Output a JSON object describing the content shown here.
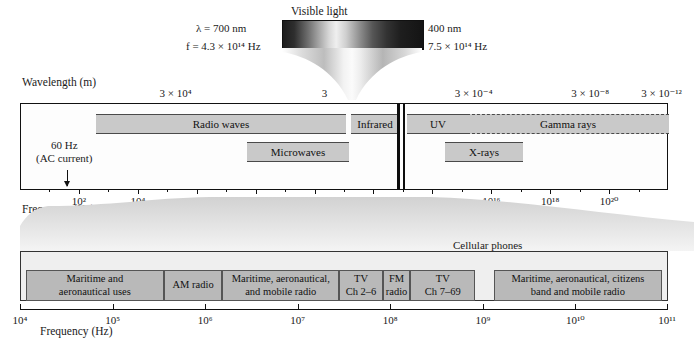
{
  "figure": {
    "visible_light": {
      "label": "Visible light",
      "left_wavelength": "λ = 700 nm",
      "left_frequency": "f = 4.3 × 10¹⁴ Hz",
      "right_wavelength": "400 nm",
      "right_frequency": "7.5 × 10¹⁴ Hz"
    }
  },
  "top_panel": {
    "wavelength_axis": {
      "title": "Wavelength (m)",
      "ticks": [
        {
          "label": "3 × 10⁴",
          "pct": 24.0
        },
        {
          "label": "3",
          "pct": 47.0
        },
        {
          "label": "3 × 10⁻⁴",
          "pct": 70.0
        },
        {
          "label": "3 × 10⁻⁸",
          "pct": 88.0
        },
        {
          "label": "3 × 10⁻¹²",
          "pct": 99.0
        }
      ]
    },
    "frequency_axis": {
      "title": "Frequency (Hz)",
      "ticks": [
        "10²",
        "10⁴",
        "10⁶",
        "10⁸",
        "10¹⁰",
        "10¹²",
        "10¹⁴",
        "10¹⁶",
        "10¹⁸",
        "10²⁰"
      ]
    },
    "annotation": {
      "line1": "60 Hz",
      "line2": "(AC current)"
    },
    "bands": [
      {
        "label": "Radio waves",
        "row": 1
      },
      {
        "label": "Infrared",
        "row": 1
      },
      {
        "label": "UV",
        "row": 1
      },
      {
        "label": "Gamma rays",
        "row": 1
      },
      {
        "label": "Microwaves",
        "row": 2
      },
      {
        "label": "X-rays",
        "row": 2
      }
    ]
  },
  "bottom_panel": {
    "callout": "Cellular phones",
    "frequency_axis": {
      "title": "Frequency (Hz)",
      "ticks": [
        "10⁴",
        "10⁵",
        "10⁶",
        "10⁷",
        "10⁸",
        "10⁹",
        "10¹⁰",
        "10¹¹"
      ]
    },
    "bands": [
      {
        "line1": "Maritime and",
        "line2": "aeronautical uses"
      },
      {
        "line1": "AM radio",
        "line2": ""
      },
      {
        "line1": "Maritime, aeronautical,",
        "line2": "and mobile radio"
      },
      {
        "line1": "TV",
        "line2": "Ch 2–6"
      },
      {
        "line1": "FM",
        "line2": "radio"
      },
      {
        "line1": "TV",
        "line2": "Ch 7–69"
      },
      {
        "line1": "Maritime, aeronautical, citizens",
        "line2": "band and mobile radio"
      }
    ]
  },
  "chart_data": {
    "type": "bar",
    "xlabel": "Frequency (Hz)",
    "ylabel": "",
    "grid": false,
    "legend": "none",
    "panels": [
      {
        "name": "full-spectrum",
        "x_axis": {
          "label": "Frequency (Hz)",
          "scale": "log10",
          "ticks": [
            2,
            4,
            6,
            8,
            10,
            12,
            14,
            16,
            18,
            20
          ],
          "tick_labels": [
            "10²",
            "10⁴",
            "10⁶",
            "10⁸",
            "10¹⁰",
            "10¹²",
            "10¹⁴",
            "10¹⁶",
            "10¹⁸",
            "10²⁰"
          ],
          "range": [
            0,
            22
          ]
        },
        "secondary_axis": {
          "label": "Wavelength (m)",
          "scale": "log10",
          "tick_labels": [
            "3 × 10⁴",
            "3",
            "3 × 10⁻⁴",
            "3 × 10⁻⁸",
            "3 × 10⁻¹²"
          ]
        },
        "bands": [
          {
            "name": "Radio waves",
            "f_min_log10": 3.0,
            "f_max_log10": 11.5,
            "row": 1
          },
          {
            "name": "Microwaves",
            "f_min_log10": 9.0,
            "f_max_log10": 12.0,
            "row": 2
          },
          {
            "name": "Infrared",
            "f_min_log10": 11.7,
            "f_max_log10": 14.4,
            "row": 1
          },
          {
            "name": "Visible light",
            "f_min_log10": 14.63,
            "f_max_log10": 14.88,
            "row": 0
          },
          {
            "name": "UV",
            "f_min_log10": 14.9,
            "f_max_log10": 16.3,
            "row": 1
          },
          {
            "name": "X-rays",
            "f_min_log10": 16.0,
            "f_max_log10": 19.2,
            "row": 2
          },
          {
            "name": "Gamma rays",
            "f_min_log10": 18.0,
            "f_max_log10": 22.0,
            "row": 1
          }
        ],
        "annotations": [
          {
            "text": "60 Hz (AC current)",
            "f_log10": 1.78
          }
        ]
      },
      {
        "name": "radio-detail",
        "x_axis": {
          "label": "Frequency (Hz)",
          "scale": "log10",
          "ticks": [
            4,
            5,
            6,
            7,
            8,
            9,
            10,
            11
          ],
          "tick_labels": [
            "10⁴",
            "10⁵",
            "10⁶",
            "10⁷",
            "10⁸",
            "10⁹",
            "10¹⁰",
            "10¹¹"
          ],
          "range": [
            4,
            11
          ]
        },
        "bands": [
          {
            "name": "Maritime and aeronautical uses",
            "f_min_log10": 4.05,
            "f_max_log10": 5.55
          },
          {
            "name": "AM radio",
            "f_min_log10": 5.55,
            "f_max_log10": 6.18
          },
          {
            "name": "Maritime, aeronautical, and mobile radio",
            "f_min_log10": 6.18,
            "f_max_log10": 7.45
          },
          {
            "name": "TV Ch 2–6",
            "f_min_log10": 7.45,
            "f_max_log10": 7.92
          },
          {
            "name": "FM radio",
            "f_min_log10": 7.92,
            "f_max_log10": 8.22
          },
          {
            "name": "TV Ch 7–69",
            "f_min_log10": 8.22,
            "f_max_log10": 8.92
          },
          {
            "name": "Cellular phones",
            "f_min_log10": 8.92,
            "f_max_log10": 9.12
          },
          {
            "name": "Maritime, aeronautical, citizens band and mobile radio",
            "f_min_log10": 9.12,
            "f_max_log10": 10.95
          }
        ],
        "annotations": [
          {
            "text": "Cellular phones",
            "f_log10": 9.0
          }
        ]
      }
    ]
  }
}
